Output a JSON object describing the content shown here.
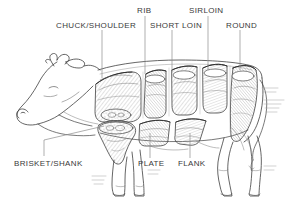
{
  "diagram": {
    "style": "pen-and-ink line engraving",
    "background_color": "#ffffff",
    "ink_color": "#3a3a3a",
    "label_color": "#3a3a3a"
  },
  "labels": {
    "chuck_shoulder": "CHUCK/SHOULDER",
    "rib": "RIB",
    "short_loin": "SHORT LOIN",
    "sirloin": "SIRLOIN",
    "round": "ROUND",
    "brisket_shank": "BRISKET/SHANK",
    "plate": "PLATE",
    "flank": "FLANK"
  },
  "callouts": [
    {
      "name": "chuck-shoulder",
      "label": "CHUCK/SHOULDER",
      "text_x": 56,
      "text_y": 26,
      "leader_x": 102,
      "leader_from_y": 30,
      "leader_to_y": 78
    },
    {
      "name": "rib",
      "label": "RIB",
      "text_x": 137,
      "text_y": 12,
      "leader_x": 145,
      "leader_from_y": 16,
      "leader_to_y": 74
    },
    {
      "name": "short-loin",
      "label": "SHORT LOIN",
      "text_x": 150,
      "text_y": 26,
      "leader_x": 172,
      "leader_from_y": 30,
      "leader_to_y": 72
    },
    {
      "name": "sirloin",
      "label": "SIRLOIN",
      "text_x": 190,
      "text_y": 12,
      "leader_x": 208,
      "leader_from_y": 16,
      "leader_to_y": 70
    },
    {
      "name": "round",
      "label": "ROUND",
      "text_x": 226,
      "text_y": 26,
      "leader_x": 240,
      "leader_from_y": 30,
      "leader_to_y": 70
    },
    {
      "name": "brisket-shank",
      "label": "BRISKET/SHANK",
      "text_x": 14,
      "text_y": 163,
      "leader_x": 44,
      "leader_from_y": 156,
      "leader_to_y": 128
    },
    {
      "name": "plate",
      "label": "PLATE",
      "text_x": 138,
      "text_y": 163,
      "leader_x": 150,
      "leader_from_y": 158,
      "leader_to_y": 132
    },
    {
      "name": "flank",
      "label": "FLANK",
      "text_x": 178,
      "text_y": 163,
      "leader_x": 190,
      "leader_from_y": 158,
      "leader_to_y": 132
    }
  ],
  "anatomy": {
    "parts": [
      "head",
      "horns",
      "ear",
      "neck",
      "body",
      "foreleg-front",
      "foreleg-back",
      "hindleg-front",
      "hindleg-back",
      "tail",
      "udder-line"
    ],
    "cut_sections": [
      {
        "name": "chuck-shoulder-cut"
      },
      {
        "name": "rib-cut"
      },
      {
        "name": "short-loin-cut"
      },
      {
        "name": "sirloin-cut"
      },
      {
        "name": "round-cut"
      },
      {
        "name": "brisket-cut"
      },
      {
        "name": "shank-cut"
      },
      {
        "name": "plate-cut"
      },
      {
        "name": "flank-cut"
      }
    ]
  }
}
